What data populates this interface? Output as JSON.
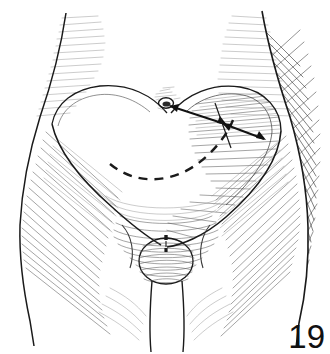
{
  "figure": {
    "number": "19",
    "domain_kind": "anatomical-line-drawing",
    "background_color": "#ffffff",
    "ink_color": "#1a1a1a",
    "hatch_color": "#5a5a5a",
    "shadow_color": "#2e2e2e"
  },
  "annotations": {
    "umbilicus_label": "umbilicus",
    "dashed_line_label": "planned-incision-dashed-line",
    "arrow_1_label": "measurement-arrow-umbilicus-to-flap-edge",
    "arrow_2_label": "measurement-arrow-flap-edge-to-lateral-margin",
    "flap_left_label": "left-abdominal-flap-outline",
    "flap_right_label": "right-abdominal-flap-outline"
  },
  "geometry": {
    "width": 330,
    "height": 354,
    "torso_outline": "M 66 14 C 60 46 52 80 40 116 C 30 148 22 186 20 224 C 19 258 24 292 30 320 L 34 344",
    "torso_outline_right": "M 262 12 C 268 44 278 80 290 116 C 300 150 307 190 308 226 C 309 262 305 296 299 322 L 296 346",
    "waist_left": "M 66 14 C 62 50 54 86 42 120",
    "waist_right": "M 262 12 C 266 48 276 84 288 118",
    "flap_left_top": "M 52 124 C 56 104 74 90 100 87 C 128 84 152 96 166 112",
    "flap_right_top": "M 170 112 C 186 94 212 84 240 88 C 266 92 280 110 280 130",
    "flap_left_lower": "M 52 124 C 58 150 80 178 112 206 C 134 226 150 238 160 244",
    "flap_right_lower": "M 280 130 C 278 158 258 188 226 216 C 202 236 180 244 166 246",
    "dashed_arc": "M 112 164 C 138 186 176 184 206 156 C 220 143 228 130 232 120",
    "umbilicus_center": [
      166,
      103
    ],
    "umbilicus_rx": 7,
    "umbilicus_ry": 5,
    "arrow_1": {
      "x1": 168,
      "y1": 105,
      "x2": 227,
      "y2": 124
    },
    "arrow_2": {
      "x1": 222,
      "y1": 122,
      "x2": 266,
      "y2": 139
    },
    "crossbar": {
      "x1": 214,
      "y1": 103,
      "x2": 232,
      "y2": 147
    },
    "pubic_mound_center": [
      166,
      260
    ],
    "pubic_mound_rx": 27,
    "pubic_mound_ry": 23,
    "inguinal_left": "M 118 228 C 128 238 132 254 128 268",
    "inguinal_right": "M 212 228 C 204 238 200 254 204 268",
    "midline_raphe": "M 166 238 L 166 285",
    "cleft": "M 155 280 C 152 304 150 328 152 348 M 180 280 C 182 304 184 328 182 348"
  }
}
